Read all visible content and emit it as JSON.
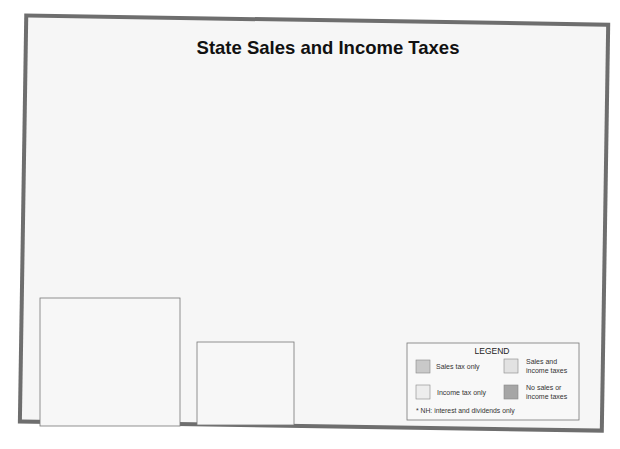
{
  "title": "State Sales and Income Taxes",
  "colors": {
    "sales_only": "#c9c9c9",
    "sales_and_income": "#e2e2e2",
    "income_only": "#ededed",
    "none": "#a6a6a6",
    "frame": "#6e6e6e",
    "paper": "#f6f6f6"
  },
  "legend": {
    "title": "LEGEND",
    "items": [
      {
        "key": "sales_only",
        "label": "Sales tax only"
      },
      {
        "key": "sales_and_income",
        "label": "Sales and income taxes"
      },
      {
        "key": "income_only",
        "label": "Income tax only"
      },
      {
        "key": "none",
        "label": "No sales or income taxes"
      }
    ],
    "footnote": "* NH: interest and dividends only"
  },
  "states": {
    "WA": "sales_only",
    "OR": "income_only",
    "CA": "sales_and_income",
    "NV": "sales_only",
    "ID": "sales_and_income",
    "MT": "income_only",
    "WY": "sales_only",
    "UT": "sales_and_income",
    "AZ": "sales_and_income",
    "CO": "sales_and_income",
    "NM": "sales_and_income",
    "ND": "sales_and_income",
    "SD": "sales_only",
    "NE": "sales_and_income",
    "KS": "sales_and_income",
    "OK": "sales_and_income",
    "TX": "sales_only",
    "MN": "sales_and_income",
    "IA": "sales_and_income",
    "MO": "sales_and_income",
    "AR": "sales_and_income",
    "LA": "sales_and_income",
    "WI": "sales_and_income",
    "IL": "sales_and_income",
    "MI": "sales_and_income",
    "IN": "sales_and_income",
    "OH": "sales_and_income",
    "KY": "sales_and_income",
    "TN": "sales_only",
    "MS": "sales_and_income",
    "AL": "sales_and_income",
    "GA": "sales_and_income",
    "FL": "sales_only",
    "SC": "sales_and_income",
    "NC": "sales_and_income",
    "VA": "sales_and_income",
    "WV": "sales_and_income",
    "PA": "sales_and_income",
    "NY": "sales_and_income",
    "VT": "sales_and_income",
    "NH": "income_only",
    "ME": "sales_and_income",
    "MA": "sales_and_income",
    "RI": "sales_and_income",
    "CT": "sales_and_income",
    "NJ": "sales_and_income",
    "DE": "income_only",
    "MD": "sales_and_income",
    "AK": "none",
    "HI": "sales_and_income"
  },
  "labels": {
    "WA": "WA",
    "OR": "OR",
    "CA": "CA",
    "NV": "NV",
    "ID": "ID",
    "MT": "MT",
    "WY": "WY",
    "UT": "UT",
    "AZ": "AZ",
    "CO": "CO",
    "NM": "NM",
    "ND": "ND",
    "SD": "SD",
    "NE": "NE",
    "KS": "KS",
    "OK": "OK",
    "TX": "TX",
    "MN": "MN",
    "IA": "IA",
    "MO": "MO",
    "AR": "AR",
    "LA": "LA",
    "WI": "WI",
    "IL": "IL",
    "MI": "MI",
    "IN": "IN",
    "OH": "OH",
    "KY": "KY",
    "TN": "TN",
    "MS": "MS",
    "AL": "AL",
    "GA": "GA",
    "FL": "FL",
    "SC": "SC",
    "NC": "NC",
    "VA": "VA",
    "WV": "WV",
    "PA": "PA",
    "NY": "NY",
    "VT": "VT",
    "NH": "NH",
    "ME": "ME",
    "MA": "MA",
    "RI": "RI",
    "CT": "CT",
    "NJ": "NJ",
    "DE": "DE",
    "MD": "MD",
    "AK": "AK",
    "HI": "HI"
  },
  "dc_label": "Washington, D.C."
}
